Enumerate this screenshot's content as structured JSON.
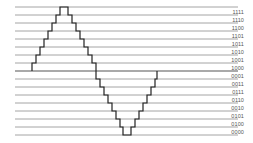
{
  "diagram": {
    "title": "",
    "line_color": "#9a9a9a",
    "trace_color": "#222222",
    "levels": [
      {
        "code": "1111"
      },
      {
        "code": "1110"
      },
      {
        "code": "1100"
      },
      {
        "code": "1101"
      },
      {
        "code": "1011"
      },
      {
        "code": "1010"
      },
      {
        "code": "1001"
      },
      {
        "code": "1000"
      },
      {
        "code": "0001"
      },
      {
        "code": "0011"
      },
      {
        "code": "0111"
      },
      {
        "code": "0110"
      },
      {
        "code": "0010"
      },
      {
        "code": "0101"
      },
      {
        "code": "0100"
      },
      {
        "code": "0000"
      }
    ]
  }
}
